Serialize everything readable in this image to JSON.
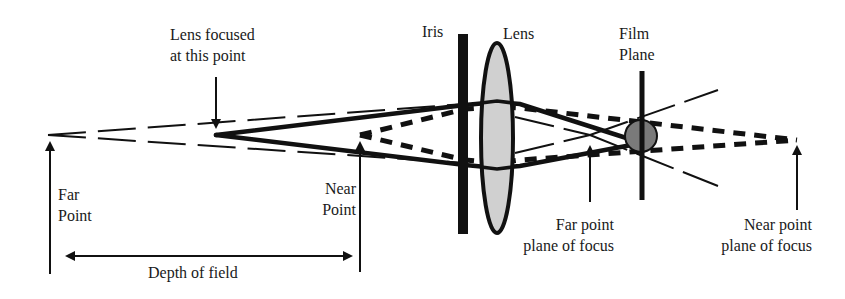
{
  "labels": {
    "lens_focused": [
      "Lens focused",
      "at this point"
    ],
    "iris": "Iris",
    "lens": "Lens",
    "film_plane": [
      "Film",
      "Plane"
    ],
    "far_point": [
      "Far",
      "Point"
    ],
    "near_point": [
      "Near",
      "Point"
    ],
    "depth_of_field": "Depth of field",
    "far_point_plane": [
      "Far point",
      "plane of focus"
    ],
    "near_point_plane": [
      "Near point",
      "plane of focus"
    ]
  },
  "colors": {
    "ink": "#111111",
    "lens_fill": "#d0d0d0",
    "blur_circle_fill": "#7a7a7a",
    "background": "#ffffff"
  },
  "geometry": {
    "axis_y": 135,
    "far_point_x": 48,
    "focus_point_x": 216,
    "near_point_x": 360,
    "iris_x": 463,
    "lens_x": 497,
    "film_plane_x": 642,
    "far_focus_x": 590,
    "near_focus_x": 797
  }
}
